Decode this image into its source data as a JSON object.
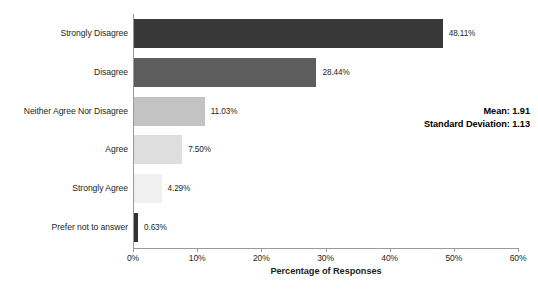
{
  "chart_data": {
    "type": "bar",
    "orientation": "horizontal",
    "title": "",
    "xlabel": "Percentage of Responses",
    "ylabel": "",
    "categories": [
      "Strongly Disagree",
      "Disagree",
      "Neither Agree Nor Disagree",
      "Agree",
      "Strongly Agree",
      "Prefer not to answer"
    ],
    "values": [
      48.11,
      28.44,
      11.03,
      7.5,
      4.29,
      0.63
    ],
    "value_labels": [
      "48.11%",
      "28.44%",
      "11.03%",
      "7.50%",
      "4.29%",
      "0.63%"
    ],
    "bar_colors": [
      "#383838",
      "#5d5d5d",
      "#c3c3c3",
      "#dedede",
      "#f0f0f0",
      "#333333"
    ],
    "xlim": [
      0,
      60
    ],
    "xticks": [
      0,
      10,
      20,
      30,
      40,
      50,
      60
    ],
    "xtick_labels": [
      "0%",
      "10%",
      "20%",
      "30%",
      "40%",
      "50%",
      "60%"
    ],
    "grid": false,
    "legend": false,
    "annotations": [
      {
        "label": "Mean:",
        "value": "1.91",
        "text": "Mean: 1.91"
      },
      {
        "label": "Standard Deviation:",
        "value": "1.13",
        "text": "Standard Deviation: 1.13"
      }
    ]
  }
}
